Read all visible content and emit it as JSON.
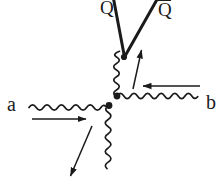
{
  "diagram": {
    "kind": "feynman-diagram",
    "line_color": "#1a1a1a",
    "background_color": "#ffffff",
    "labels": {
      "quark": "Q",
      "antiquark_base": "Q",
      "antiquark_overbar": true,
      "antiquark_display": "Q̄",
      "incoming_left": "a",
      "incoming_right": "b"
    },
    "arrows": [
      {
        "name": "momentum-arrow-a",
        "direction": "right",
        "x1": 32,
        "y1": 119,
        "x2": 88,
        "y2": 119
      },
      {
        "name": "momentum-arrow-b",
        "direction": "left",
        "x1": 200,
        "y1": 86,
        "x2": 140,
        "y2": 86
      },
      {
        "name": "momentum-arrow-internal-up",
        "direction": "up",
        "x1": 133,
        "y1": 89,
        "x2": 142,
        "y2": 47
      },
      {
        "name": "momentum-arrow-outgoing-down",
        "direction": "down-left",
        "x1": 92,
        "y1": 126,
        "x2": 69,
        "y2": 179
      }
    ],
    "vertices": [
      {
        "name": "vertex-top",
        "x": 124,
        "y": 57
      },
      {
        "name": "vertex-upper",
        "x": 117,
        "y": 96
      },
      {
        "name": "vertex-lower",
        "x": 109,
        "y": 105
      }
    ],
    "wavy_lines": [
      {
        "name": "boson-line-a",
        "from": "left-edge",
        "to": "vertex-lower"
      },
      {
        "name": "boson-line-b",
        "from": "vertex-upper",
        "to": "right-edge"
      },
      {
        "name": "boson-line-internal",
        "from": "vertex-upper",
        "to": "vertex-top"
      },
      {
        "name": "boson-line-outgoing",
        "from": "vertex-lower",
        "to": "bottom-edge"
      }
    ],
    "straight_lines": [
      {
        "name": "quark-line-Q",
        "from": "vertex-top",
        "to": "top-edge-left"
      },
      {
        "name": "antiquark-line-Qbar",
        "from": "vertex-top",
        "to": "top-edge-right"
      }
    ]
  }
}
